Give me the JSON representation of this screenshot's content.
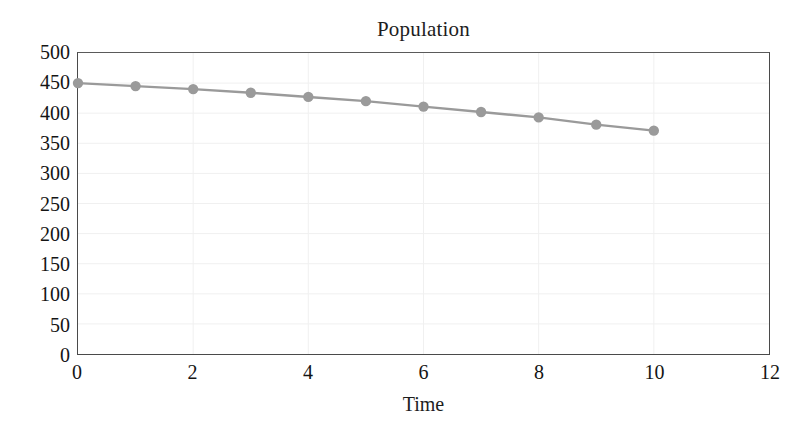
{
  "chart_data": {
    "type": "line",
    "title": "Population",
    "xlabel": "Time",
    "ylabel": "",
    "xlim": [
      0,
      12
    ],
    "ylim": [
      0,
      500
    ],
    "xticks": [
      0,
      2,
      4,
      6,
      8,
      10,
      12
    ],
    "yticks": [
      0,
      50,
      100,
      150,
      200,
      250,
      300,
      350,
      400,
      450,
      500
    ],
    "grid": true,
    "legend": false,
    "x": [
      0,
      1,
      2,
      3,
      4,
      5,
      6,
      7,
      8,
      9,
      10
    ],
    "values": [
      450,
      445,
      440,
      434,
      427,
      420,
      411,
      402,
      393,
      381,
      371
    ],
    "series": [
      {
        "name": "Population",
        "color": "#9a9a9a",
        "marker": "circle",
        "values": [
          450,
          445,
          440,
          434,
          427,
          420,
          411,
          402,
          393,
          381,
          371
        ]
      }
    ]
  },
  "style": {
    "line_color": "#9a9a9a",
    "marker_color": "#9a9a9a",
    "grid_color": "#f0f0f0",
    "axis_color": "#4a4a4a",
    "text_color": "#141414",
    "background": "#ffffff"
  }
}
